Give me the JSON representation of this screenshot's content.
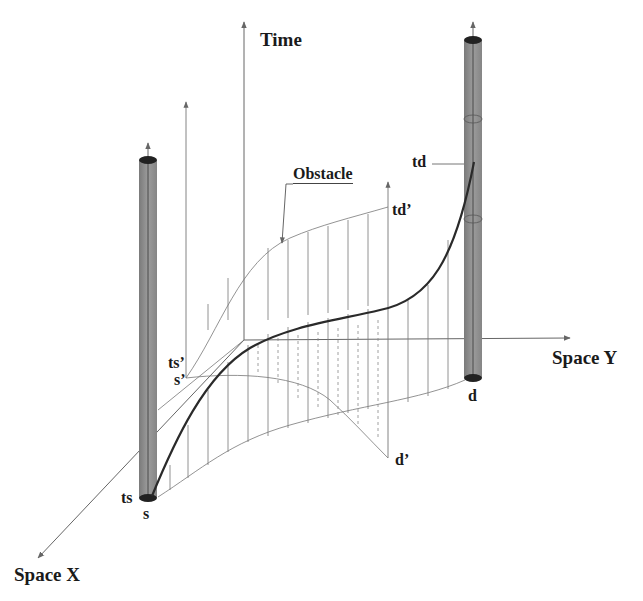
{
  "figure": {
    "type": "space-time diagram",
    "axes": {
      "time": "Time",
      "space_y": "Space Y",
      "space_x": "Space X"
    },
    "labels": {
      "obstacle": "Obstacle",
      "source_time": "ts",
      "source": "s",
      "dest_time": "td",
      "dest": "d",
      "obstacle_start_time": "ts’",
      "obstacle_start": "s’",
      "obstacle_end_time": "td’",
      "obstacle_end": "d’"
    },
    "colors": {
      "line": "#555555",
      "path": "#2a2a2a",
      "cylinder": "#8c8c8c",
      "cylinder_cap": "#222222"
    }
  }
}
